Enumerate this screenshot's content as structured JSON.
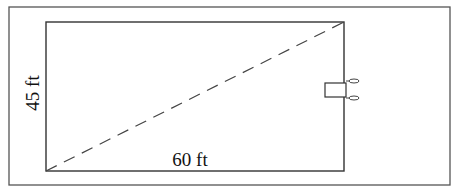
{
  "diagram": {
    "type": "rectangle-with-diagonal",
    "labels": {
      "height": "45 ft",
      "width": "60 ft"
    },
    "diagonal": {
      "style": "dashed",
      "from": "bottom-left",
      "to": "top-right"
    },
    "object": {
      "name": "lawn-mower",
      "position": "right-edge-middle"
    },
    "colors": {
      "line": "#333333",
      "frame": "#555555",
      "background": "#ffffff"
    }
  }
}
